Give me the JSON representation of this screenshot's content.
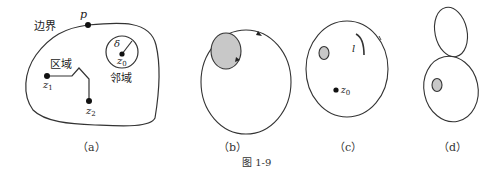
{
  "figure": {
    "caption": "图 1-9",
    "panels": [
      {
        "id": "a",
        "label": "（a）",
        "texts": {
          "boundary": "边界",
          "point_p": "p",
          "region": "区域",
          "neighborhood": "邻域",
          "delta": "δ",
          "z0_main": "z",
          "z0_sub": "0",
          "z1_main": "z",
          "z1_sub": "1",
          "z2_main": "z",
          "z2_sub": "2"
        }
      },
      {
        "id": "b",
        "label": "（b）"
      },
      {
        "id": "c",
        "label": "（c）",
        "texts": {
          "curve_l": "l",
          "z0_main": "z",
          "z0_sub": "0"
        }
      },
      {
        "id": "d",
        "label": "（d）"
      }
    ],
    "colors": {
      "stroke": "#333333",
      "hole_fill": "#c8c8c8",
      "point": "#111111"
    }
  }
}
